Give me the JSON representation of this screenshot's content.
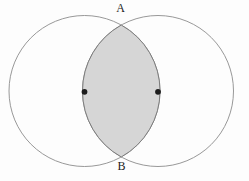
{
  "figure": {
    "labels": {
      "top": {
        "text": "A",
        "x": 120.5,
        "y": 11.5
      },
      "bottom": {
        "text": "B",
        "x": 121.5,
        "y": 170
      }
    },
    "colors": {
      "background": "#fdfdfd",
      "circle_stroke": "#8c8c8c",
      "lens_fill": "#d6d6d6",
      "lens_stroke": "#7d7d7d",
      "dot_fill": "#1c1c1c",
      "label_color": "#222222"
    },
    "geometry": {
      "left_circle": {
        "cx": 84.5,
        "cy": 91,
        "r": 75.5
      },
      "right_circle": {
        "cx": 158.0,
        "cy": 91,
        "r": 75.5
      },
      "left_dot": {
        "cx": 84.5,
        "cy": 91.8,
        "r": 2.9
      },
      "right_dot": {
        "cx": 158.0,
        "cy": 91.8,
        "r": 2.9
      }
    }
  }
}
